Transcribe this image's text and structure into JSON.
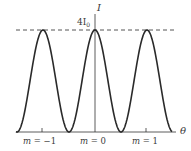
{
  "diagram": {
    "y_axis_label": "I",
    "x_axis_label": "θ",
    "peak_label": "4I",
    "peak_label_subscript": "0",
    "order_labels": [
      {
        "m": "m",
        "eq": "=",
        "val": "−1"
      },
      {
        "m": "m",
        "eq": "=",
        "val": "0"
      },
      {
        "m": "m",
        "eq": "=",
        "val": "1"
      }
    ],
    "line_color": "#2a2a2a",
    "dash_color": "#555555"
  },
  "chart_data": {
    "type": "line",
    "title": "",
    "xlabel": "θ",
    "ylabel": "I",
    "function": "I = 4 I0 cos^2(phi/2)",
    "max_value_label": "4I0",
    "maxima_orders": [
      -1,
      0,
      1
    ],
    "x": [
      -1.5,
      -1.0,
      -0.5,
      0,
      0.5,
      1.0,
      1.5
    ],
    "values": [
      0,
      4,
      0,
      4,
      0,
      4,
      0
    ],
    "ylim": [
      0,
      4
    ],
    "grid": false,
    "reference_line": {
      "y": 4,
      "style": "dashed",
      "label": "4I0"
    }
  }
}
